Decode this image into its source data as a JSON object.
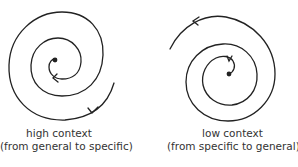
{
  "diagram": {
    "stroke_color": "#222222",
    "background": "#ffffff",
    "spirals": [
      {
        "id": "high-context",
        "direction": "inward",
        "caption_line1": "high context",
        "caption_line2": "(from general to specific)"
      },
      {
        "id": "low-context",
        "direction": "outward",
        "caption_line1": "low context",
        "caption_line2": "(from specific to general)"
      }
    ]
  }
}
